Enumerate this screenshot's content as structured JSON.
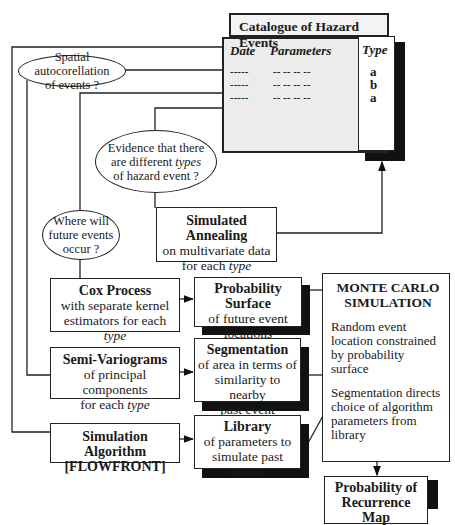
{
  "catalogue": {
    "title": "Catalogue of Hazard Events",
    "columns": {
      "date": "Date",
      "parameters": "Parameters",
      "type": "Type"
    },
    "rows": [
      {
        "date": "-----",
        "parameters": "-- -- -- --",
        "type": "a"
      },
      {
        "date": "-----",
        "parameters": "-- -- -- --",
        "type": "b"
      },
      {
        "date": "-----",
        "parameters": "-- -- -- --",
        "type": "a"
      }
    ]
  },
  "questions": {
    "spatial": {
      "line1": "Spatial autocorellation",
      "line2": "of events ?"
    },
    "evidence": {
      "line1": "Evidence that there",
      "line2_pre": "are different ",
      "line2_em": "types",
      "line3": "of hazard event ?"
    },
    "where": {
      "line1": "Where will",
      "line2": "future events",
      "line3": "occur ?"
    }
  },
  "boxes": {
    "annealing": {
      "title": "Simulated Annealing",
      "line1": "on multivariate data",
      "line2_pre": "for each ",
      "line2_em": "type"
    },
    "cox": {
      "title": "Cox Process",
      "line1": "with separate kernel",
      "line2_pre": "estimators for each ",
      "line2_em": "type"
    },
    "probsurf": {
      "title": "Probability Surface",
      "line1": "of future event",
      "line2": "locations"
    },
    "semivar": {
      "title": "Semi-Variograms",
      "line1": "of principal components",
      "line2_pre": "for each ",
      "line2_em": "type"
    },
    "segmentation": {
      "title": "Segmentation",
      "line1": "of area in terms of",
      "line2": "similarity to nearby",
      "line3": "past event"
    },
    "simalg": {
      "title": "Simulation Algorithm",
      "line1": "[FLOWFRONT]"
    },
    "library": {
      "title": "Library",
      "line1": "of parameters to",
      "line2": "simulate past events"
    },
    "montecarlo": {
      "title1": "MONTE CARLO",
      "title2": "SIMULATION",
      "p1": "Random event location constrained by probability surface",
      "p2": "Segmentation directs choice of algorithm parameters from library"
    },
    "recurrence": {
      "line1": "Probability of",
      "line2": "Recurrence",
      "line3": "Map"
    }
  }
}
